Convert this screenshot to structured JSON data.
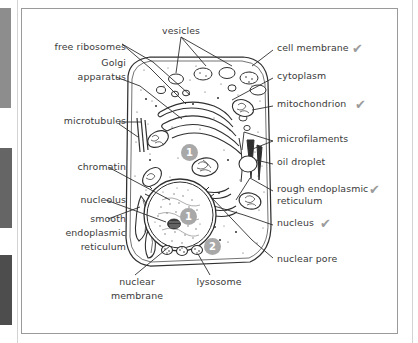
{
  "figure": {
    "checkmark_glyph": "✔",
    "checkmark_color": "#9b9b9b",
    "marker_color": "#a8a8a8",
    "ink_color": "#2f2f2f"
  },
  "labels_left": [
    {
      "id": "free-ribosomes",
      "text": "free ribosomes",
      "x": 30,
      "y": 46,
      "w": 96
    },
    {
      "id": "golgi-1",
      "text": "Golgi",
      "x": 30,
      "y": 62,
      "w": 96
    },
    {
      "id": "golgi-2",
      "text": "apparatus",
      "x": 30,
      "y": 76,
      "w": 96
    },
    {
      "id": "microtubules",
      "text": "microtubules",
      "x": 30,
      "y": 120,
      "w": 96
    },
    {
      "id": "chromatin",
      "text": "chromatin",
      "x": 30,
      "y": 168,
      "w": 96
    },
    {
      "id": "nucleolus",
      "text": "nucleolus",
      "x": 30,
      "y": 200,
      "w": 96
    },
    {
      "id": "smooth-er-1",
      "text": "smooth",
      "x": 30,
      "y": 219,
      "w": 96
    },
    {
      "id": "smooth-er-2",
      "text": "endoplasmic",
      "x": 30,
      "y": 233,
      "w": 96
    },
    {
      "id": "smooth-er-3",
      "text": "reticulum",
      "x": 30,
      "y": 247,
      "w": 96
    }
  ],
  "labels_right": [
    {
      "id": "cell-membrane",
      "text": "cell membrane",
      "x": 277,
      "y": 47,
      "check": true
    },
    {
      "id": "cytoplasm",
      "text": "cytoplasm",
      "x": 277,
      "y": 75,
      "check": false
    },
    {
      "id": "mitochondrion",
      "text": "mitochondrion",
      "x": 277,
      "y": 103,
      "check": true
    },
    {
      "id": "microfilaments",
      "text": "microfilaments",
      "x": 277,
      "y": 138,
      "check": false
    },
    {
      "id": "oil-droplet",
      "text": "oil droplet",
      "x": 277,
      "y": 161,
      "check": false
    },
    {
      "id": "rough-er-1",
      "text": "rough endoplasmic",
      "x": 277,
      "y": 188,
      "check": true
    },
    {
      "id": "rough-er-2",
      "text": "reticulum",
      "x": 277,
      "y": 200,
      "check": false
    },
    {
      "id": "nucleus",
      "text": "nucleus",
      "x": 277,
      "y": 222,
      "check": true
    },
    {
      "id": "nuclear-pore",
      "text": "nuclear pore",
      "x": 277,
      "y": 258,
      "check": false
    }
  ],
  "labels_bottom": [
    {
      "id": "vesicles",
      "text": "vesicles",
      "x": 148,
      "y": 30,
      "w": 60
    },
    {
      "id": "nuclear-membrane-1",
      "text": "nuclear",
      "x": 110,
      "y": 281,
      "w": 60
    },
    {
      "id": "nuclear-membrane-2",
      "text": "membrane",
      "x": 103,
      "y": 295,
      "w": 74
    },
    {
      "id": "lysosome",
      "text": "lysosome",
      "x": 190,
      "y": 281,
      "w": 62
    }
  ],
  "markers": [
    {
      "id": "marker-1a",
      "text": "1",
      "x": 181,
      "y": 144
    },
    {
      "id": "marker-1b",
      "text": "1",
      "x": 180,
      "y": 208
    },
    {
      "id": "marker-2",
      "text": "2",
      "x": 204,
      "y": 238
    }
  ]
}
